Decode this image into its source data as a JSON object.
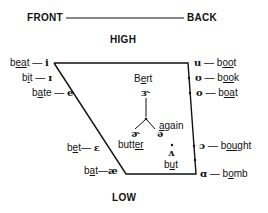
{
  "header": {
    "front": "FRONT",
    "back": "BACK",
    "high": "HIGH",
    "low": "LOW"
  },
  "front_vowels": [
    {
      "word_pre": "b",
      "word_ul": "ea",
      "word_post": "t",
      "dash": "—",
      "symbol": "i"
    },
    {
      "word_pre": "b",
      "word_ul": "i",
      "word_post": "t",
      "dash": "—",
      "symbol": "ɪ"
    },
    {
      "word_pre": "b",
      "word_ul": "a",
      "word_post": "te",
      "dash": "—",
      "symbol": "e"
    },
    {
      "word_pre": "b",
      "word_ul": "e",
      "word_post": "t",
      "dash": "—",
      "symbol": "ɛ"
    },
    {
      "word_pre": "b",
      "word_ul": "a",
      "word_post": "t",
      "dash": "—",
      "symbol": "æ"
    }
  ],
  "back_vowels": [
    {
      "symbol": "u",
      "dash": "—",
      "word_pre": "b",
      "word_ul": "oo",
      "word_post": "t"
    },
    {
      "symbol": "ʊ",
      "dash": "—",
      "word_pre": "b",
      "word_ul": "oo",
      "word_post": "k"
    },
    {
      "symbol": "o",
      "dash": "—",
      "word_pre": "b",
      "word_ul": "oa",
      "word_post": "t"
    },
    {
      "symbol": "ɔ",
      "dash": "—",
      "word_pre": "b",
      "word_ul": "ou",
      "word_post": "ght"
    },
    {
      "symbol": "ɑ",
      "dash": "—",
      "word_pre": "b",
      "word_ul": "o",
      "word_post": "mb"
    }
  ],
  "central_vowels": {
    "bert": {
      "word_pre": "B",
      "word_ul": "e",
      "word_post": "rt",
      "symbol": "ɝ"
    },
    "butter": {
      "word_pre": "butt",
      "word_ul": "er",
      "word_post": "",
      "symbol": "ɚ"
    },
    "again": {
      "word_pre": "",
      "word_ul": "a",
      "word_post": "gain",
      "symbol": "ə"
    },
    "but": {
      "word_pre": "b",
      "word_ul": "u",
      "word_post": "t",
      "symbol": "ʌ"
    }
  },
  "colors": {
    "ink": "#111111",
    "background": "#ffffff"
  }
}
